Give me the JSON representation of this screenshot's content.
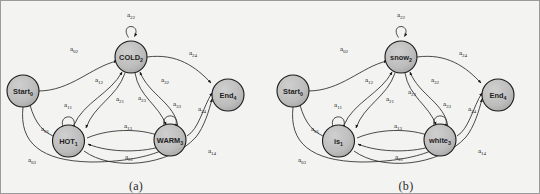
{
  "figure": {
    "kind": "finite-state-automaton-pair",
    "background_color": "#f3f3f1",
    "node_fill_color": "#b9b9b9",
    "node_stroke_color": "#1a1a1a",
    "edge_color": "#2b2b2b"
  },
  "panels": [
    {
      "id": "a",
      "caption": "(a)",
      "nodes": [
        {
          "id": "start",
          "base": "Start",
          "sub": "0"
        },
        {
          "id": "cold",
          "base": "COLD",
          "sub": "2"
        },
        {
          "id": "hot",
          "base": "HOT",
          "sub": "1"
        },
        {
          "id": "warm",
          "base": "WARM",
          "sub": "3"
        },
        {
          "id": "end",
          "base": "End",
          "sub": "4"
        }
      ],
      "edges": [
        {
          "id": "a22",
          "base": "a",
          "sub": "22",
          "from": "cold",
          "to": "cold"
        },
        {
          "id": "a02",
          "base": "a",
          "sub": "02",
          "from": "start",
          "to": "cold"
        },
        {
          "id": "a24",
          "base": "a",
          "sub": "24",
          "from": "cold",
          "to": "end"
        },
        {
          "id": "a12",
          "base": "a",
          "sub": "12",
          "from": "hot",
          "to": "cold"
        },
        {
          "id": "a21",
          "base": "a",
          "sub": "21",
          "from": "cold",
          "to": "hot"
        },
        {
          "id": "a23",
          "base": "a",
          "sub": "23",
          "from": "cold",
          "to": "warm"
        },
        {
          "id": "a32",
          "base": "a",
          "sub": "32",
          "from": "warm",
          "to": "cold"
        },
        {
          "id": "a11",
          "base": "a",
          "sub": "11",
          "from": "hot",
          "to": "hot"
        },
        {
          "id": "a33",
          "base": "a",
          "sub": "33",
          "from": "warm",
          "to": "warm"
        },
        {
          "id": "a13",
          "base": "a",
          "sub": "13",
          "from": "hot",
          "to": "warm"
        },
        {
          "id": "a31",
          "base": "a",
          "sub": "31",
          "from": "warm",
          "to": "hot"
        },
        {
          "id": "a01",
          "base": "a",
          "sub": "01",
          "from": "start",
          "to": "hot"
        },
        {
          "id": "a03",
          "base": "a",
          "sub": "03",
          "from": "start",
          "to": "warm"
        },
        {
          "id": "a34",
          "base": "a",
          "sub": "34",
          "from": "warm",
          "to": "end"
        },
        {
          "id": "a14",
          "base": "a",
          "sub": "14",
          "from": "hot",
          "to": "end"
        }
      ]
    },
    {
      "id": "b",
      "caption": "(b)",
      "nodes": [
        {
          "id": "start",
          "base": "Start",
          "sub": "0"
        },
        {
          "id": "cold",
          "base": "snow",
          "sub": "2"
        },
        {
          "id": "hot",
          "base": "is",
          "sub": "1"
        },
        {
          "id": "warm",
          "base": "white",
          "sub": "3"
        },
        {
          "id": "end",
          "base": "End",
          "sub": "4"
        }
      ],
      "edges": [
        {
          "id": "a22",
          "base": "a",
          "sub": "22",
          "from": "cold",
          "to": "cold"
        },
        {
          "id": "a02",
          "base": "a",
          "sub": "02",
          "from": "start",
          "to": "cold"
        },
        {
          "id": "a24",
          "base": "a",
          "sub": "24",
          "from": "cold",
          "to": "end"
        },
        {
          "id": "a12",
          "base": "a",
          "sub": "12",
          "from": "hot",
          "to": "cold"
        },
        {
          "id": "a21",
          "base": "a",
          "sub": "21",
          "from": "cold",
          "to": "hot"
        },
        {
          "id": "a23",
          "base": "a",
          "sub": "23",
          "from": "cold",
          "to": "warm"
        },
        {
          "id": "a32",
          "base": "a",
          "sub": "32",
          "from": "warm",
          "to": "cold"
        },
        {
          "id": "a11",
          "base": "a",
          "sub": "11",
          "from": "hot",
          "to": "hot"
        },
        {
          "id": "a33",
          "base": "a",
          "sub": "33",
          "from": "warm",
          "to": "warm"
        },
        {
          "id": "a13",
          "base": "a",
          "sub": "13",
          "from": "hot",
          "to": "warm"
        },
        {
          "id": "a31",
          "base": "a",
          "sub": "31",
          "from": "warm",
          "to": "hot"
        },
        {
          "id": "a01",
          "base": "a",
          "sub": "01",
          "from": "start",
          "to": "hot"
        },
        {
          "id": "a03",
          "base": "a",
          "sub": "03",
          "from": "start",
          "to": "warm"
        },
        {
          "id": "a34",
          "base": "a",
          "sub": "34",
          "from": "warm",
          "to": "end"
        },
        {
          "id": "a14",
          "base": "a",
          "sub": "14",
          "from": "hot",
          "to": "end"
        }
      ]
    }
  ]
}
